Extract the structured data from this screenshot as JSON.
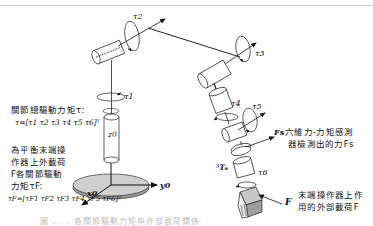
{
  "diagram": {
    "joint_labels": [
      "τ1",
      "τ2",
      "τ3",
      "τ4",
      "τ5",
      "τ6"
    ],
    "axis_labels": {
      "z0": "z0",
      "y0": "y0",
      "x0": "x0"
    },
    "transform_label": "⁵T₆",
    "sensor_force_symbol": "Fs",
    "external_force_symbol": "F"
  },
  "annotations": {
    "joint_torque": {
      "line1": "關節總驅動力矩τ:",
      "line2": "τ=[τ1 τ2 τ3 τ4 τ5 τ6]ᵀ"
    },
    "balance_torque": {
      "line1": "為平衡末端操",
      "line2": "作器上外載荷",
      "line3": "F各關節驅動",
      "line4": "力矩τF:",
      "line5": "τF=[τF1  τF2  τF3  τF4  τF5  τF6]ᵀ"
    },
    "sensor": {
      "line1": "六維力-力矩感測",
      "line2": "器檢測出的力Fs"
    },
    "external_load": {
      "line1": "末端操作器上作",
      "line2": "用的外部載荷F"
    }
  },
  "caption": "圖 . . . 各關節驅動力矩與外部載荷關係"
}
